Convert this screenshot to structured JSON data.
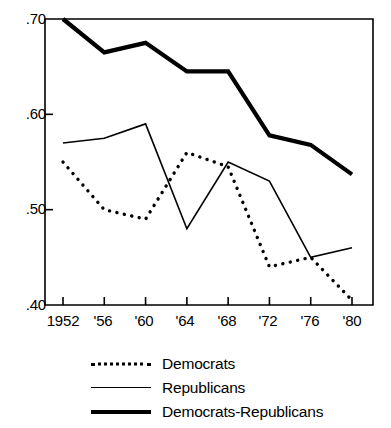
{
  "chart_data": {
    "type": "line",
    "title": "",
    "xlabel": "",
    "ylabel": "",
    "categories": [
      "1952",
      "'56",
      "'60",
      "'64",
      "'68",
      "'72",
      "'76",
      "'80"
    ],
    "x": [
      1952,
      1956,
      1960,
      1964,
      1968,
      1972,
      1976,
      1980
    ],
    "ylim": [
      0.4,
      0.7
    ],
    "xlim": [
      1950,
      1982
    ],
    "yticks": [
      0.4,
      0.5,
      0.6,
      0.7
    ],
    "ytick_labels": [
      ".40",
      ".50",
      ".60",
      ".70"
    ],
    "grid": false,
    "legend_position": "below-center",
    "series": [
      {
        "name": "Democrats",
        "style": "dotted",
        "values": [
          0.55,
          0.5,
          0.49,
          0.56,
          0.545,
          0.44,
          0.45,
          0.405
        ]
      },
      {
        "name": "Republicans",
        "style": "thin-solid",
        "values": [
          0.57,
          0.575,
          0.59,
          0.48,
          0.55,
          0.53,
          0.45,
          0.46
        ]
      },
      {
        "name": "Democrats-Republicans",
        "style": "thick-solid",
        "values": [
          0.7,
          0.665,
          0.675,
          0.645,
          0.645,
          0.578,
          0.568,
          0.537
        ]
      }
    ]
  },
  "axes": {
    "y_labels": [
      {
        "text": ".70"
      },
      {
        "text": ".60"
      },
      {
        "text": ".50"
      },
      {
        "text": ".40"
      }
    ],
    "x_labels": [
      {
        "text": "1952"
      },
      {
        "text": "'56"
      },
      {
        "text": "'60"
      },
      {
        "text": "'64"
      },
      {
        "text": "'68"
      },
      {
        "text": "'72"
      },
      {
        "text": "'76"
      },
      {
        "text": "'80"
      }
    ]
  },
  "legend": {
    "items": [
      {
        "label": "Democrats"
      },
      {
        "label": "Republicans"
      },
      {
        "label": "Democrats-Republicans"
      }
    ]
  },
  "colors": {
    "line": "#000000",
    "background": "#ffffff",
    "frame": "#000000"
  }
}
